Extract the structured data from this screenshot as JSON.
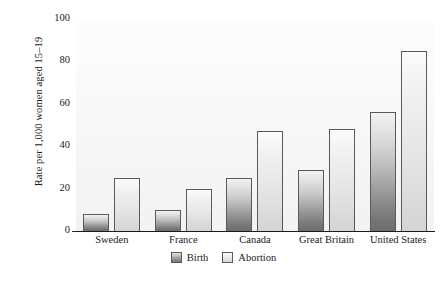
{
  "chart_data": {
    "type": "bar",
    "title": "",
    "xlabel": "",
    "ylabel": "Rate per 1,000 women aged 15–19",
    "ylim": [
      0,
      100
    ],
    "yticks": [
      0,
      20,
      40,
      60,
      80,
      100
    ],
    "grid": false,
    "legend_position": "bottom",
    "categories": [
      "Sweden",
      "France",
      "Canada",
      "Great Britain",
      "United States"
    ],
    "series": [
      {
        "name": "Birth",
        "color": "#8b8b8b",
        "values": [
          8,
          10,
          25,
          29,
          56
        ]
      },
      {
        "name": "Abortion",
        "color": "#e2e2e2",
        "values": [
          25,
          20,
          47,
          48,
          85
        ]
      }
    ]
  },
  "axis": {
    "y_title": "Rate per 1,000 women aged 15–19",
    "ticks": [
      {
        "label": "100",
        "value": 100
      },
      {
        "label": "80",
        "value": 80
      },
      {
        "label": "60",
        "value": 60
      },
      {
        "label": "40",
        "value": 40
      },
      {
        "label": "20",
        "value": 20
      },
      {
        "label": "0",
        "value": 0
      }
    ]
  },
  "legend": {
    "items": [
      {
        "label": "Birth"
      },
      {
        "label": "Abortion"
      }
    ]
  },
  "colors": {
    "birth_dark": "#6e6e6e",
    "birth_light": "#f2f2f2",
    "abortion_dark": "#d4d4d4",
    "abortion_light": "#fbfbfb",
    "bar_outline": "#5a5a5a",
    "axis": "#1b1b1b",
    "text": "#1a1a1a",
    "plot_background": "#f7f7f7"
  }
}
